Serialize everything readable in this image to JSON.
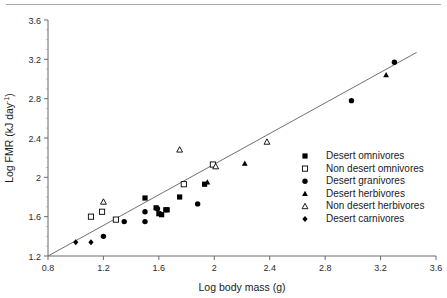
{
  "figure": {
    "background_color": "#ffffff",
    "axis_color": "#6b6b6b",
    "marker_color": "#000000",
    "line_color": "#707070"
  },
  "chart_data": {
    "type": "scatter",
    "title": "",
    "xlabel": "Log body mass (g)",
    "ylabel_main": "Log FMR (kJ day",
    "ylabel_sup": "-1",
    "ylabel_tail": ")",
    "xlim": [
      0.8,
      3.6
    ],
    "ylim": [
      1.2,
      3.6
    ],
    "xticks": [
      "0.8",
      "1.2",
      "1.6",
      "2",
      "2.4",
      "2.8",
      "3.2",
      "3.6"
    ],
    "xtick_values": [
      0.8,
      1.2,
      1.6,
      2.0,
      2.4,
      2.8,
      3.2,
      3.6
    ],
    "yticks": [
      "1.2",
      "1.6",
      "2",
      "2.4",
      "2.8",
      "3.2",
      "3.6"
    ],
    "ytick_values": [
      1.2,
      1.6,
      2.0,
      2.4,
      2.8,
      3.2,
      3.6
    ],
    "grid": false,
    "legend_position": "right",
    "trend_line": {
      "x1": 0.8,
      "y1": 1.2,
      "x2": 3.46,
      "y2": 3.27
    },
    "series": [
      {
        "name": "Desert omnivores",
        "marker": "filled-square",
        "points": [
          [
            1.5,
            1.79
          ],
          [
            1.58,
            1.69
          ],
          [
            1.6,
            1.63
          ],
          [
            1.62,
            1.62
          ],
          [
            1.65,
            1.67
          ],
          [
            1.66,
            1.67
          ],
          [
            1.75,
            1.8
          ],
          [
            1.93,
            1.93
          ]
        ]
      },
      {
        "name": "Non desert omnivores",
        "marker": "open-square",
        "points": [
          [
            1.11,
            1.6
          ],
          [
            1.19,
            1.65
          ],
          [
            1.29,
            1.57
          ],
          [
            1.78,
            1.93
          ],
          [
            1.99,
            2.13
          ]
        ]
      },
      {
        "name": "Desert granivores",
        "marker": "filled-circle",
        "points": [
          [
            1.2,
            1.4
          ],
          [
            1.35,
            1.55
          ],
          [
            1.5,
            1.55
          ],
          [
            1.5,
            1.65
          ],
          [
            1.59,
            1.68
          ],
          [
            1.88,
            1.73
          ],
          [
            2.99,
            2.78
          ],
          [
            3.3,
            3.17
          ]
        ]
      },
      {
        "name": "Desert herbivores",
        "marker": "filled-triangle",
        "points": [
          [
            1.95,
            1.95
          ],
          [
            2.22,
            2.14
          ],
          [
            3.24,
            3.04
          ]
        ]
      },
      {
        "name": "Non desert herbivores",
        "marker": "open-triangle",
        "points": [
          [
            1.2,
            1.75
          ],
          [
            1.75,
            2.28
          ],
          [
            2.01,
            2.11
          ],
          [
            2.38,
            2.36
          ]
        ]
      },
      {
        "name": "Desert carnivores",
        "marker": "filled-diamond",
        "points": [
          [
            1.0,
            1.34
          ],
          [
            1.11,
            1.34
          ]
        ]
      }
    ]
  },
  "legend": {
    "items": [
      {
        "label": "Desert omnivores",
        "marker": "filled-square"
      },
      {
        "label": "Non desert omnivores",
        "marker": "open-square"
      },
      {
        "label": "Desert granivores",
        "marker": "filled-circle"
      },
      {
        "label": "Desert herbivores",
        "marker": "filled-triangle"
      },
      {
        "label": "Non desert herbivores",
        "marker": "open-triangle"
      },
      {
        "label": "Desert carnivores",
        "marker": "filled-diamond"
      }
    ]
  }
}
